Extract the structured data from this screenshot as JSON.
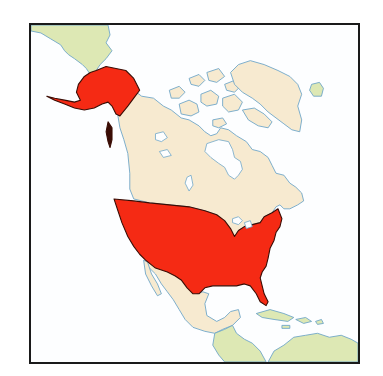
{
  "map": {
    "title": "United States highlighted on map of North America",
    "highlighted_country": "United States",
    "highlighted_regions": [
      "Contiguous United States",
      "Alaska"
    ],
    "other_regions": [
      "Canada",
      "Greenland",
      "Mexico",
      "Central America",
      "Caribbean",
      "Russia (Chukotka)",
      "South America",
      "Iceland"
    ],
    "colors": {
      "highlight": "#f52a14",
      "highlight_outline": "#3a0d05",
      "north_america_land": "#f7ead0",
      "other_land": "#dde8b4",
      "water": "#fdfeff",
      "coastline": "#6fa6c8",
      "frame": "#1a1a1a"
    }
  }
}
